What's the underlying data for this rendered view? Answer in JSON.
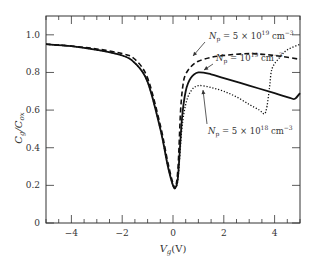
{
  "chart_data": {
    "type": "line",
    "title": "",
    "xlabel": "V_g(V)",
    "ylabel": "C_g/C_ox",
    "xlim": [
      -5,
      5
    ],
    "ylim": [
      0,
      1.1
    ],
    "x_ticks": [
      -4,
      -2,
      0,
      2,
      4
    ],
    "x_tick_labels": [
      "−4",
      "−2",
      "0",
      "2",
      "4"
    ],
    "y_ticks": [
      0,
      0.2,
      0.4,
      0.6,
      0.8,
      1.0
    ],
    "y_tick_labels": [
      "0",
      "0.2",
      "0.4",
      "0.6",
      "0.8",
      "1.0"
    ],
    "grid": false,
    "legend": "inline annotations",
    "series": [
      {
        "name": "N_p = 5×10^19 cm^-3",
        "style": "dashed",
        "x": [
          -5,
          -4,
          -3,
          -2,
          -1.5,
          -1,
          -0.5,
          -0.2,
          0,
          0.1,
          0.2,
          0.3,
          0.4,
          0.5,
          0.7,
          1,
          1.5,
          2,
          3,
          4,
          5
        ],
        "y": [
          0.95,
          0.94,
          0.925,
          0.9,
          0.87,
          0.77,
          0.52,
          0.32,
          0.21,
          0.19,
          0.3,
          0.6,
          0.74,
          0.79,
          0.83,
          0.86,
          0.88,
          0.89,
          0.9,
          0.89,
          0.87
        ]
      },
      {
        "name": "N_p = 10^19 cm^-3",
        "style": "solid",
        "x": [
          -5,
          -4,
          -3,
          -2,
          -1.5,
          -1,
          -0.5,
          -0.2,
          0,
          0.1,
          0.2,
          0.35,
          0.5,
          0.7,
          1,
          1.5,
          2,
          3,
          4,
          4.6,
          4.8,
          5
        ],
        "y": [
          0.95,
          0.94,
          0.92,
          0.89,
          0.85,
          0.75,
          0.5,
          0.3,
          0.2,
          0.19,
          0.25,
          0.55,
          0.7,
          0.77,
          0.8,
          0.79,
          0.77,
          0.73,
          0.69,
          0.665,
          0.66,
          0.69
        ]
      },
      {
        "name": "N_p = 5×10^18 cm^-3",
        "style": "dotted",
        "x": [
          -5,
          -4,
          -3,
          -2,
          -1.5,
          -1,
          -0.5,
          -0.2,
          0,
          0.1,
          0.2,
          0.35,
          0.5,
          0.7,
          1,
          1.5,
          2,
          2.5,
          3,
          3.4,
          3.6,
          3.7,
          3.8,
          3.9,
          4.2,
          4.5,
          5
        ],
        "y": [
          0.95,
          0.94,
          0.92,
          0.89,
          0.85,
          0.75,
          0.5,
          0.3,
          0.2,
          0.19,
          0.24,
          0.5,
          0.63,
          0.7,
          0.73,
          0.72,
          0.7,
          0.67,
          0.63,
          0.6,
          0.58,
          0.62,
          0.72,
          0.82,
          0.88,
          0.92,
          0.95
        ]
      }
    ],
    "annotations": [
      {
        "text_main": "N",
        "sub": "p",
        "eq": " = 5 × 10",
        "sup": "19",
        "unit": " cm",
        "unit_sup": "−3",
        "series": 0
      },
      {
        "text_main": "N",
        "sub": "p",
        "eq": " = 10",
        "sup": "19",
        "unit": " cm",
        "unit_sup": "−3",
        "series": 1
      },
      {
        "text_main": "N",
        "sub": "p",
        "eq": " = 5 × 10",
        "sup": "18",
        "unit": " cm",
        "unit_sup": "−3",
        "series": 2
      }
    ]
  }
}
